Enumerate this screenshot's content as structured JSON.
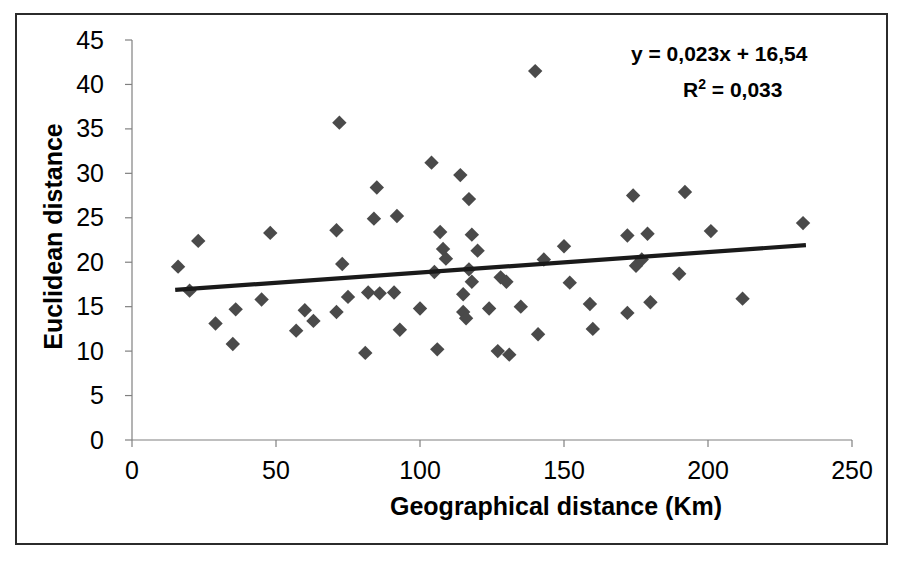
{
  "chart_data": {
    "type": "scatter",
    "title": "",
    "xlabel": "Geographical distance (Km)",
    "ylabel": "Euclidean distance",
    "xlim": [
      0,
      250
    ],
    "ylim": [
      0,
      45
    ],
    "xticks": [
      0,
      50,
      100,
      150,
      200,
      250
    ],
    "yticks": [
      0,
      5,
      10,
      15,
      20,
      25,
      30,
      35,
      40,
      45
    ],
    "grid": false,
    "legend": false,
    "marker": "diamond",
    "marker_color": "#4a4a4a",
    "trendline": {
      "equation_label": "y = 0,023x + 16,54",
      "r2_label": "R² = 0,033",
      "slope": 0.023,
      "intercept": 16.54,
      "r2": 0.033,
      "x_start": 15,
      "x_end": 234,
      "color": "#1a1a1a"
    },
    "points": [
      {
        "x": 16,
        "y": 19.5
      },
      {
        "x": 20,
        "y": 16.8
      },
      {
        "x": 23,
        "y": 22.4
      },
      {
        "x": 29,
        "y": 13.1
      },
      {
        "x": 35,
        "y": 10.8
      },
      {
        "x": 36,
        "y": 14.7
      },
      {
        "x": 45,
        "y": 15.8
      },
      {
        "x": 48,
        "y": 23.3
      },
      {
        "x": 57,
        "y": 12.3
      },
      {
        "x": 60,
        "y": 14.6
      },
      {
        "x": 63,
        "y": 13.4
      },
      {
        "x": 71,
        "y": 23.6
      },
      {
        "x": 71,
        "y": 14.4
      },
      {
        "x": 72,
        "y": 35.7
      },
      {
        "x": 73,
        "y": 19.8
      },
      {
        "x": 75,
        "y": 16.1
      },
      {
        "x": 81,
        "y": 9.8
      },
      {
        "x": 82,
        "y": 16.6
      },
      {
        "x": 84,
        "y": 24.9
      },
      {
        "x": 85,
        "y": 28.4
      },
      {
        "x": 86,
        "y": 16.5
      },
      {
        "x": 91,
        "y": 16.6
      },
      {
        "x": 92,
        "y": 25.2
      },
      {
        "x": 93,
        "y": 12.4
      },
      {
        "x": 100,
        "y": 14.8
      },
      {
        "x": 104,
        "y": 31.2
      },
      {
        "x": 105,
        "y": 18.9
      },
      {
        "x": 106,
        "y": 10.2
      },
      {
        "x": 107,
        "y": 23.4
      },
      {
        "x": 108,
        "y": 21.5
      },
      {
        "x": 109,
        "y": 20.4
      },
      {
        "x": 114,
        "y": 29.8
      },
      {
        "x": 115,
        "y": 16.4
      },
      {
        "x": 115,
        "y": 14.4
      },
      {
        "x": 116,
        "y": 13.7
      },
      {
        "x": 117,
        "y": 27.1
      },
      {
        "x": 117,
        "y": 19.2
      },
      {
        "x": 118,
        "y": 23.1
      },
      {
        "x": 118,
        "y": 17.8
      },
      {
        "x": 120,
        "y": 21.3
      },
      {
        "x": 124,
        "y": 14.8
      },
      {
        "x": 127,
        "y": 10.0
      },
      {
        "x": 128,
        "y": 18.3
      },
      {
        "x": 130,
        "y": 17.8
      },
      {
        "x": 131,
        "y": 9.6
      },
      {
        "x": 135,
        "y": 15.0
      },
      {
        "x": 140,
        "y": 41.5
      },
      {
        "x": 141,
        "y": 11.9
      },
      {
        "x": 143,
        "y": 20.3
      },
      {
        "x": 150,
        "y": 21.8
      },
      {
        "x": 152,
        "y": 17.7
      },
      {
        "x": 159,
        "y": 15.3
      },
      {
        "x": 160,
        "y": 12.5
      },
      {
        "x": 172,
        "y": 23.0
      },
      {
        "x": 172,
        "y": 14.3
      },
      {
        "x": 174,
        "y": 27.5
      },
      {
        "x": 175,
        "y": 19.6
      },
      {
        "x": 177,
        "y": 20.3
      },
      {
        "x": 179,
        "y": 23.2
      },
      {
        "x": 180,
        "y": 15.5
      },
      {
        "x": 190,
        "y": 18.7
      },
      {
        "x": 192,
        "y": 27.9
      },
      {
        "x": 201,
        "y": 23.5
      },
      {
        "x": 212,
        "y": 15.9
      },
      {
        "x": 233,
        "y": 24.4
      }
    ]
  },
  "axes": {
    "y_title": "Euclidean distance",
    "x_title": "Geographical distance (Km)",
    "y_tick_labels": [
      "45",
      "40",
      "35",
      "30",
      "25",
      "20",
      "15",
      "10",
      "5",
      "0"
    ],
    "x_tick_labels": [
      "0",
      "50",
      "100",
      "150",
      "200",
      "250"
    ]
  },
  "annotations": {
    "equation": "y = 0,023x + 16,54",
    "r2_prefix": "R",
    "r2_exponent": "2",
    "r2_suffix": " = 0,033"
  },
  "colors": {
    "marker": "#4a4a4a",
    "trendline": "#1a1a1a",
    "axis": "#808080",
    "frame": "#2b2b2b",
    "text": "#000000"
  }
}
